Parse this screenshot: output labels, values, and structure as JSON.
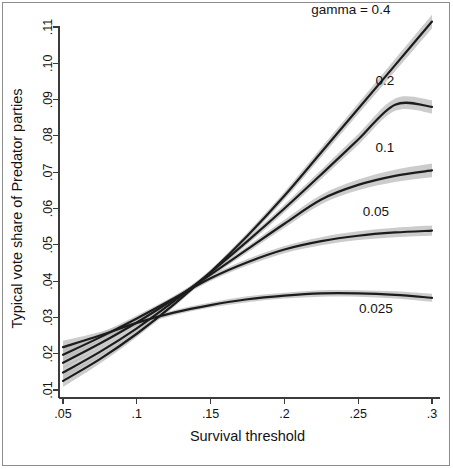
{
  "figure": {
    "kind": "statistical-line-plot",
    "background_color": "#ffffff",
    "frame_color": "#8d8d8d",
    "line_color": "#1c1c1c",
    "ci_band_color": "#b9b9b9"
  },
  "chart_data": {
    "type": "line",
    "title": "",
    "xlabel": "Survival threshold",
    "ylabel": "Typical vote share of Predator parties",
    "xlim": [
      0.05,
      0.3
    ],
    "ylim": [
      0.01,
      0.115
    ],
    "grid": false,
    "legend_position": "inline-right-annotations",
    "legend_prefix": "gamma = ",
    "xticks": [
      0.05,
      0.1,
      0.15,
      0.2,
      0.25,
      0.3
    ],
    "xticklabels": [
      ".05",
      ".1",
      ".15",
      ".2",
      ".25",
      ".3"
    ],
    "yticks": [
      0.01,
      0.02,
      0.03,
      0.04,
      0.05,
      0.06,
      0.07,
      0.08,
      0.09,
      0.1,
      0.11
    ],
    "yticklabels": [
      ".01",
      ".02",
      ".03",
      ".04",
      ".05",
      ".06",
      ".07",
      ".08",
      ".09",
      ".10",
      ".11"
    ],
    "x": [
      0.05,
      0.075,
      0.1,
      0.125,
      0.15,
      0.175,
      0.2,
      0.225,
      0.25,
      0.275,
      0.3
    ],
    "series": [
      {
        "name": "gamma = 0.4",
        "label": "gamma = 0.4",
        "label_text": "gamma = 0.4",
        "values": [
          0.0125,
          0.0185,
          0.0255,
          0.0335,
          0.0425,
          0.0525,
          0.0635,
          0.0755,
          0.0875,
          0.0995,
          0.1115
        ],
        "ci_low": [
          0.0108,
          0.0173,
          0.0246,
          0.0328,
          0.0418,
          0.0516,
          0.0624,
          0.0742,
          0.086,
          0.0978,
          0.1096
        ],
        "ci_high": [
          0.0142,
          0.0197,
          0.0264,
          0.0342,
          0.0432,
          0.0534,
          0.0646,
          0.0768,
          0.089,
          0.1012,
          0.1134
        ]
      },
      {
        "name": "gamma = 0.2",
        "label": "0.2",
        "label_text": "0.2",
        "values": [
          0.0148,
          0.0205,
          0.027,
          0.0344,
          0.0424,
          0.051,
          0.06,
          0.0694,
          0.079,
          0.0886,
          0.088
        ],
        "ci_low": [
          0.0131,
          0.0193,
          0.0261,
          0.0337,
          0.0417,
          0.0501,
          0.0589,
          0.0681,
          0.0775,
          0.0869,
          0.0862
        ],
        "ci_high": [
          0.0165,
          0.0217,
          0.0279,
          0.0351,
          0.0431,
          0.0519,
          0.0611,
          0.0707,
          0.0805,
          0.0903,
          0.0898
        ]
      },
      {
        "name": "gamma = 0.1",
        "label": "0.1",
        "label_text": "0.1",
        "values": [
          0.0175,
          0.0228,
          0.0286,
          0.035,
          0.0418,
          0.0488,
          0.0558,
          0.0625,
          0.0665,
          0.069,
          0.0705
        ],
        "ci_low": [
          0.0158,
          0.0216,
          0.0277,
          0.0343,
          0.0411,
          0.0479,
          0.0547,
          0.0612,
          0.065,
          0.0673,
          0.0686
        ],
        "ci_high": [
          0.0192,
          0.024,
          0.0295,
          0.0357,
          0.0425,
          0.0497,
          0.0569,
          0.0638,
          0.068,
          0.0707,
          0.0724
        ]
      },
      {
        "name": "gamma = 0.05",
        "label": "0.05",
        "label_text": "0.05",
        "values": [
          0.0197,
          0.0245,
          0.0297,
          0.0352,
          0.0408,
          0.0452,
          0.0487,
          0.051,
          0.0525,
          0.0534,
          0.0539
        ],
        "ci_low": [
          0.018,
          0.0234,
          0.0289,
          0.0345,
          0.04,
          0.0443,
          0.0477,
          0.0499,
          0.0513,
          0.0521,
          0.0525
        ],
        "ci_high": [
          0.0214,
          0.0256,
          0.0305,
          0.0359,
          0.0416,
          0.0461,
          0.0497,
          0.0521,
          0.0537,
          0.0547,
          0.0553
        ]
      },
      {
        "name": "gamma = 0.025",
        "label": "0.025",
        "label_text": "0.025",
        "values": [
          0.0218,
          0.025,
          0.0285,
          0.0313,
          0.0334,
          0.035,
          0.036,
          0.0366,
          0.0366,
          0.0362,
          0.0354
        ],
        "ci_low": [
          0.02,
          0.024,
          0.0277,
          0.0306,
          0.0327,
          0.0342,
          0.0352,
          0.0357,
          0.0357,
          0.0352,
          0.0343
        ],
        "ci_high": [
          0.0236,
          0.026,
          0.0293,
          0.032,
          0.0341,
          0.0358,
          0.0368,
          0.0375,
          0.0375,
          0.0372,
          0.0365
        ]
      }
    ],
    "annotations": [
      {
        "text": "gamma = 0.4",
        "x": 0.245,
        "y": 0.1135
      },
      {
        "text": "0.2",
        "x": 0.268,
        "y": 0.094
      },
      {
        "text": "0.1",
        "x": 0.268,
        "y": 0.0755
      },
      {
        "text": "0.05",
        "x": 0.262,
        "y": 0.058
      },
      {
        "text": "0.025",
        "x": 0.262,
        "y": 0.0312
      }
    ]
  }
}
